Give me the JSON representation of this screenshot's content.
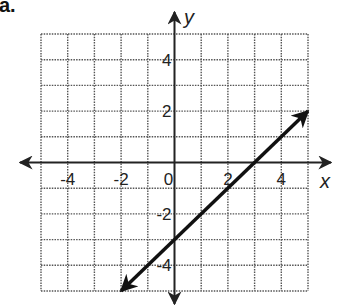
{
  "part_label": "a.",
  "chart_data": {
    "type": "line",
    "title": "",
    "xlabel": "x",
    "ylabel": "y",
    "xlim": [
      -5,
      5
    ],
    "ylim": [
      -5,
      5
    ],
    "grid": true,
    "grid_style": "dotted",
    "x_ticks": [
      -4,
      -2,
      0,
      2,
      4
    ],
    "y_ticks": [
      4,
      2,
      -2,
      -4
    ],
    "x_tick_labels": [
      "-4",
      "-2",
      "0",
      "2",
      "4"
    ],
    "y_tick_labels": [
      "4",
      "2",
      "-2",
      "-4"
    ],
    "series": [
      {
        "name": "line",
        "equation": "y = x - 3",
        "slope": 1,
        "y_intercept": -3,
        "x_intercept": 3,
        "x": [
          -2,
          5
        ],
        "y": [
          -5,
          2
        ],
        "arrows_both_ends": true,
        "color": "#111111"
      }
    ]
  },
  "colors": {
    "axis": "#222222",
    "grid": "#555555",
    "line": "#111111"
  }
}
